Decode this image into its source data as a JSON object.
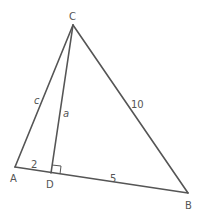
{
  "diagram": {
    "type": "triangle-with-altitude",
    "vertices": {
      "A": {
        "label": "A",
        "x": 15,
        "y": 167
      },
      "B": {
        "label": "B",
        "x": 188,
        "y": 193
      },
      "C": {
        "label": "C",
        "x": 73,
        "y": 25
      },
      "D": {
        "label": "D",
        "x": 51,
        "y": 173
      }
    },
    "segments": {
      "AC": {
        "label": "c"
      },
      "CD": {
        "label": "a"
      },
      "BC": {
        "label": "10"
      },
      "AD": {
        "label": "2"
      },
      "DB": {
        "label": "5"
      }
    },
    "right_angle_at": "D",
    "colors": {
      "stroke": "#555555",
      "text": "#555555",
      "background": "#ffffff"
    }
  }
}
